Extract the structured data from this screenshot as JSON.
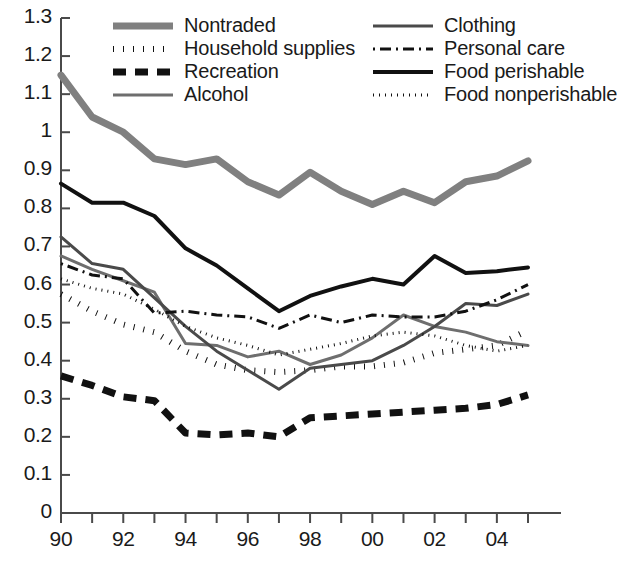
{
  "chart_data": {
    "type": "line",
    "title": "",
    "xlabel": "",
    "ylabel": "",
    "xlim": [
      1990,
      2005
    ],
    "ylim": [
      0,
      1.3
    ],
    "grid": false,
    "legend_position": "top-inside",
    "x": [
      1990,
      1991,
      1992,
      1993,
      1994,
      1995,
      1996,
      1997,
      1998,
      1999,
      2000,
      2001,
      2002,
      2003,
      2004,
      2005
    ],
    "xtick_labels": [
      "90",
      "",
      "92",
      "",
      "94",
      "",
      "96",
      "",
      "98",
      "",
      "00",
      "",
      "02",
      "",
      "04",
      ""
    ],
    "xtick_labels_shown": [
      "90",
      "92",
      "94",
      "96",
      "98",
      "00",
      "02",
      "04"
    ],
    "ytick_labels": [
      "0",
      "0.1",
      "0.2",
      "0.3",
      "0.4",
      "0.5",
      "0.6",
      "0.7",
      "0.8",
      "0.9",
      "1",
      "1.1",
      "1.2",
      "1.3"
    ],
    "ytick_values": [
      0,
      0.1,
      0.2,
      0.3,
      0.4,
      0.5,
      0.6,
      0.7,
      0.8,
      0.9,
      1.0,
      1.1,
      1.2,
      1.3
    ],
    "series": [
      {
        "name": "Nontraded",
        "style": "solid-thick-gray",
        "color": "#808080",
        "width": 7,
        "dash": "none",
        "values": [
          1.15,
          1.04,
          1.0,
          0.93,
          0.915,
          0.93,
          0.87,
          0.835,
          0.895,
          0.845,
          0.81,
          0.845,
          0.815,
          0.87,
          0.885,
          0.925
        ]
      },
      {
        "name": "Household supplies",
        "style": "dotted-thick-black",
        "color": "#111111",
        "width": 6,
        "dash": "1,9",
        "values": [
          0.575,
          0.53,
          0.495,
          0.475,
          0.425,
          0.39,
          0.375,
          0.37,
          0.375,
          0.385,
          0.385,
          0.395,
          0.42,
          0.43,
          0.44,
          0.48
        ]
      },
      {
        "name": "Recreation",
        "style": "dashed-thick-black",
        "color": "#111111",
        "width": 7,
        "dash": "13,9",
        "values": [
          0.36,
          0.335,
          0.305,
          0.295,
          0.21,
          0.205,
          0.21,
          0.2,
          0.25,
          0.255,
          0.26,
          0.265,
          0.27,
          0.275,
          0.285,
          0.31
        ]
      },
      {
        "name": "Alcohol",
        "style": "solid-medium-gray",
        "color": "#6e6e6e",
        "width": 3,
        "dash": "none",
        "values": [
          0.675,
          0.64,
          0.61,
          0.58,
          0.445,
          0.44,
          0.41,
          0.425,
          0.39,
          0.415,
          0.46,
          0.52,
          0.49,
          0.475,
          0.45,
          0.44
        ]
      },
      {
        "name": "Clothing",
        "style": "solid-thin-dark",
        "color": "#4a4a4a",
        "width": 3,
        "dash": "none",
        "values": [
          0.725,
          0.655,
          0.64,
          0.565,
          0.49,
          0.425,
          0.375,
          0.325,
          0.38,
          0.39,
          0.4,
          0.44,
          0.49,
          0.55,
          0.545,
          0.575
        ]
      },
      {
        "name": "Personal care",
        "style": "dash-dot-black",
        "color": "#111111",
        "width": 3,
        "dash": "2,5,11,5",
        "values": [
          0.655,
          0.625,
          0.615,
          0.525,
          0.53,
          0.52,
          0.515,
          0.485,
          0.52,
          0.5,
          0.52,
          0.515,
          0.515,
          0.53,
          0.56,
          0.6
        ]
      },
      {
        "name": "Food perishable",
        "style": "solid-black",
        "color": "#111111",
        "width": 4,
        "dash": "none",
        "values": [
          0.865,
          0.815,
          0.815,
          0.78,
          0.695,
          0.65,
          0.59,
          0.53,
          0.57,
          0.595,
          0.615,
          0.6,
          0.675,
          0.63,
          0.635,
          0.645
        ]
      },
      {
        "name": "Food nonperishable",
        "style": "dotted-thin-black",
        "color": "#111111",
        "width": 3,
        "dash": "1,5",
        "values": [
          0.615,
          0.59,
          0.575,
          0.535,
          0.49,
          0.46,
          0.44,
          0.415,
          0.43,
          0.445,
          0.465,
          0.475,
          0.465,
          0.44,
          0.425,
          0.44
        ]
      }
    ],
    "legend_columns": [
      [
        "Nontraded",
        "Household supplies",
        "Recreation",
        "Alcohol"
      ],
      [
        "Clothing",
        "Personal care",
        "Food perishable",
        "Food nonperishable"
      ]
    ]
  },
  "axes": {
    "y_axis_label_count": 14,
    "x_axis_label_count": 8
  }
}
